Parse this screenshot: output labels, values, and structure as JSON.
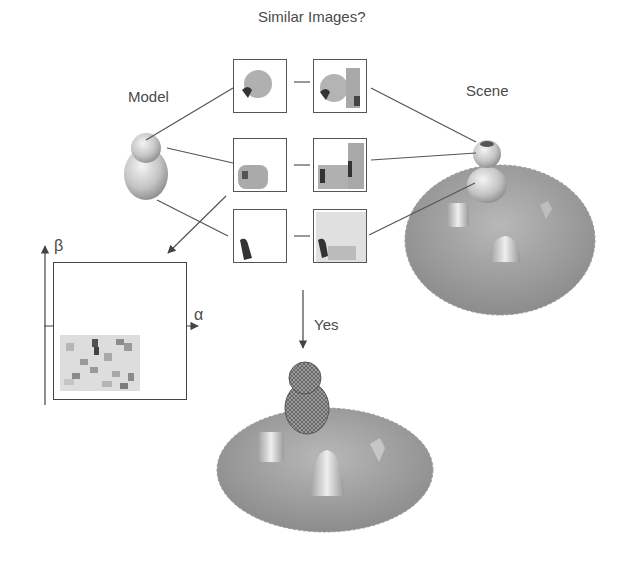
{
  "title": "Similar Images?",
  "labels": {
    "model": "Model",
    "scene": "Scene",
    "decision": "Yes"
  },
  "axes": {
    "x_label": "α",
    "y_label": "β"
  },
  "image_pairs": [
    {
      "model_image": "model-spin-image-1",
      "scene_image": "scene-spin-image-1"
    },
    {
      "model_image": "model-spin-image-2",
      "scene_image": "scene-spin-image-2"
    },
    {
      "model_image": "model-spin-image-3",
      "scene_image": "scene-spin-image-3"
    }
  ],
  "colors": {
    "line": "#555555",
    "text": "#4a4a4a",
    "surface": "#9a9a9a"
  }
}
